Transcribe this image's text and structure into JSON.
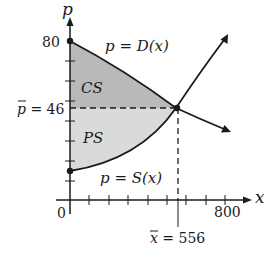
{
  "axes": {
    "x_label": "x",
    "y_label": "p",
    "origin_label": "0",
    "x_tick_label": "800",
    "y_tick_label": "80",
    "x_range": [
      0,
      800
    ],
    "y_range": [
      0,
      80
    ],
    "x_tick_step": 100,
    "y_tick_step": 10
  },
  "curves": {
    "demand": {
      "label_var": "p",
      "label_eq": " = ",
      "label_fn": "D(x)",
      "start": [
        0,
        80
      ],
      "end_arrow": [
        830,
        35
      ]
    },
    "supply": {
      "label_var": "p",
      "label_eq": " = ",
      "label_fn": "S(x)",
      "start": [
        0,
        15
      ],
      "end_arrow": [
        808,
        82
      ]
    }
  },
  "equilibrium": {
    "x_value": "556",
    "p_value": "46",
    "x_label_var": "x",
    "x_label_eq": " = 556",
    "p_label_var": "p",
    "p_label_eq": " = 46"
  },
  "regions": {
    "cs": {
      "label": "CS",
      "color": "#b9b9b9"
    },
    "ps": {
      "label": "PS",
      "color": "#dadada"
    }
  },
  "colors": {
    "line": "#1a1a1a",
    "background": "#ffffff"
  }
}
